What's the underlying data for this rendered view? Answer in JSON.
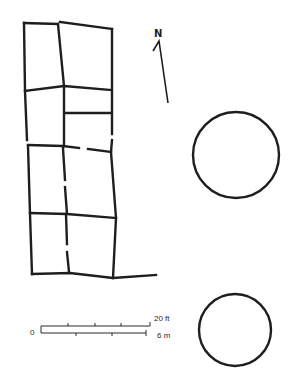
{
  "diagram": {
    "type": "architectural-site-plan",
    "north_arrow": {
      "label": "N"
    },
    "scale_bar": {
      "zero_label": "0",
      "imperial_label": "20 ft",
      "metric_label": "6 m"
    },
    "features": [
      {
        "name": "rectangular-room-block",
        "rooms_visible": 9
      },
      {
        "name": "circular-structure-upper"
      },
      {
        "name": "circular-structure-lower"
      }
    ],
    "colors": {
      "ink": "#1e1e1e",
      "background": "#ffffff"
    }
  }
}
